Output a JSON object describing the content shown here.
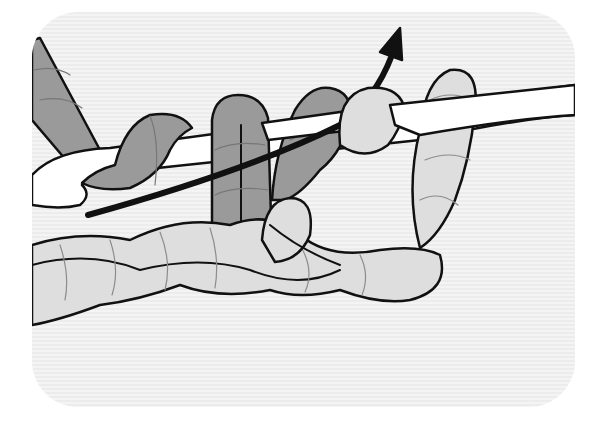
{
  "illustration": {
    "subject": "crochet hook with yarn loops and chain",
    "colors": {
      "background": "#efefef",
      "outline": "#111111",
      "dark_yarn": "#9a9a9a",
      "light_yarn": "#dedede",
      "hook": "#ffffff",
      "arrow": "#111111",
      "twist_lines": "#8c8c8c"
    },
    "icons": [
      "arrow-up-right-icon"
    ]
  }
}
